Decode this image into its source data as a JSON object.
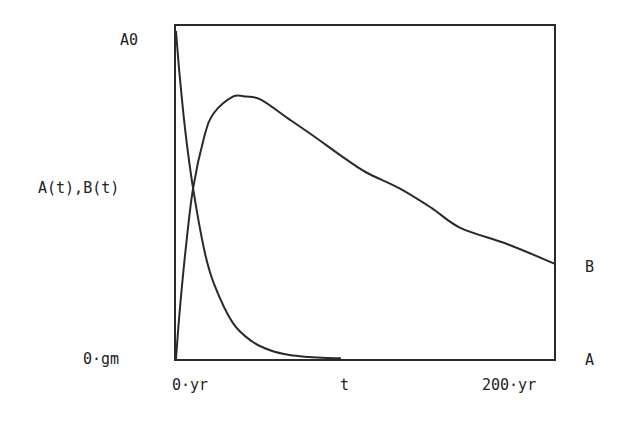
{
  "chart_data": {
    "type": "line",
    "title": "",
    "xlabel": "t",
    "ylabel": "A(t),B(t)",
    "x_tick_labels": [
      "0·yr",
      "200·yr"
    ],
    "y_tick_labels": [
      "0·gm",
      "A0"
    ],
    "xlim": [
      0,
      200
    ],
    "ylim": [
      0,
      1
    ],
    "x_units": "yr",
    "y_units": "fraction of A0",
    "grid": false,
    "legend": "right-end labels",
    "series": [
      {
        "name": "A",
        "end_label": "A",
        "x": [
          0,
          2,
          5,
          9,
          15,
          20,
          30,
          40,
          50,
          60,
          70,
          80,
          87
        ],
        "values": [
          1.0,
          0.86,
          0.69,
          0.52,
          0.33,
          0.23,
          0.11,
          0.054,
          0.026,
          0.012,
          0.006,
          0.003,
          0.002
        ]
      },
      {
        "name": "B",
        "end_label": "B",
        "x": [
          0,
          2,
          5,
          9,
          15,
          20,
          30,
          37,
          45,
          60,
          75,
          87,
          100,
          118,
          135,
          150,
          175,
          200
        ],
        "values": [
          0.0,
          0.15,
          0.33,
          0.52,
          0.68,
          0.75,
          0.8,
          0.8,
          0.79,
          0.73,
          0.67,
          0.62,
          0.57,
          0.52,
          0.46,
          0.4,
          0.35,
          0.29
        ]
      }
    ]
  }
}
